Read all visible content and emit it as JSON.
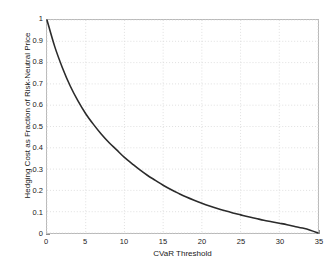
{
  "chart_data": {
    "type": "line",
    "title": "",
    "xlabel": "CVaR Threshold",
    "ylabel": "Hedging Cost as Fraction of Risk-Neutral Price",
    "xlim": [
      0,
      35
    ],
    "ylim": [
      0,
      1
    ],
    "grid": true,
    "legend": null,
    "line_color": "#2b2b2b",
    "line_width": 1.6,
    "xticks": [
      "0",
      "5",
      "10",
      "15",
      "20",
      "25",
      "30",
      "35"
    ],
    "xtick_values": [
      0,
      5,
      10,
      15,
      20,
      25,
      30,
      35
    ],
    "yticks": [
      "0",
      "0.1",
      "0.2",
      "0.3",
      "0.4",
      "0.5",
      "0.6",
      "0.7",
      "0.8",
      "0.9",
      "1"
    ],
    "ytick_values": [
      0,
      0.1,
      0.2,
      0.3,
      0.4,
      0.5,
      0.6,
      0.7,
      0.8,
      0.9,
      1
    ],
    "series": [
      {
        "name": "Hedging Cost",
        "x": [
          0,
          1,
          2,
          3,
          4,
          5,
          6,
          7,
          8,
          9,
          10,
          11,
          12,
          13,
          14,
          15,
          16,
          17,
          18,
          19,
          20,
          21,
          22,
          23,
          24,
          25,
          26,
          27,
          28,
          29,
          30,
          31,
          32,
          33,
          34,
          35
        ],
        "y": [
          1.0,
          0.875,
          0.775,
          0.69,
          0.62,
          0.56,
          0.51,
          0.465,
          0.425,
          0.39,
          0.355,
          0.325,
          0.296,
          0.27,
          0.247,
          0.224,
          0.204,
          0.186,
          0.169,
          0.154,
          0.14,
          0.127,
          0.115,
          0.104,
          0.094,
          0.085,
          0.076,
          0.068,
          0.06,
          0.053,
          0.046,
          0.039,
          0.031,
          0.023,
          0.013,
          0.0
        ]
      }
    ]
  },
  "axes": {
    "background_color": "#ffffff",
    "border_color": "#b9b9b9",
    "grid_color": "#d8d8d8"
  }
}
